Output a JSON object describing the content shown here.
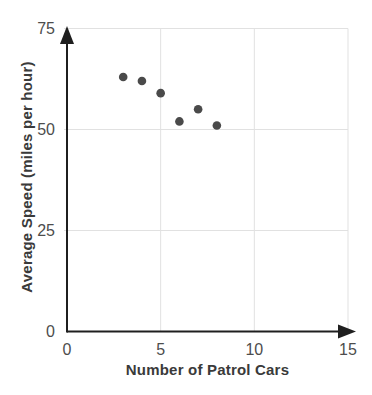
{
  "chart_data": {
    "type": "scatter",
    "title": "",
    "xlabel": "Number of Patrol Cars",
    "ylabel": "Average Speed (miles per hour)",
    "points": [
      {
        "x": 3,
        "y": 63
      },
      {
        "x": 4,
        "y": 62
      },
      {
        "x": 5,
        "y": 59
      },
      {
        "x": 6,
        "y": 52
      },
      {
        "x": 7,
        "y": 55
      },
      {
        "x": 8,
        "y": 51
      }
    ],
    "xlim": [
      0,
      15
    ],
    "ylim": [
      0,
      75
    ],
    "x_ticks": [
      0,
      5,
      10,
      15
    ],
    "y_ticks": [
      0,
      25,
      50,
      75
    ],
    "grid": "on",
    "legend": "none",
    "point_color": "#4a4a4a",
    "grid_color": "#e1e1e1",
    "axis_color": "#1f1f1f",
    "tick_label_color": "#4d4d4d",
    "axis_title_color": "#3a3a3a",
    "background_color": "#ffffff"
  }
}
